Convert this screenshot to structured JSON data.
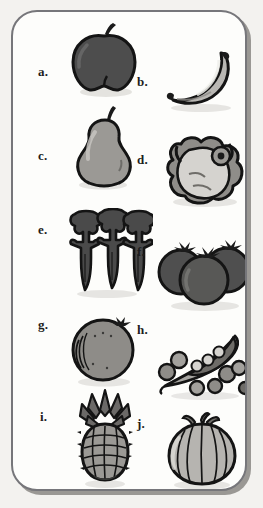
{
  "worksheet": {
    "title": "Fruits and vegetables picture panel",
    "panel": {
      "background_color": "#fdfdfb",
      "border_color": "#76767a",
      "shadow_color": "#9a9894",
      "page_background": "#f3f2ef"
    },
    "layout": {
      "columns": 2,
      "arrangement": "zigzag",
      "item_count": 10
    },
    "items": [
      {
        "label": "a.",
        "name": "apple",
        "column": "left",
        "tone": "dark-gray"
      },
      {
        "label": "b.",
        "name": "banana",
        "column": "right",
        "tone": "light-gray"
      },
      {
        "label": "c.",
        "name": "pear",
        "column": "left",
        "tone": "mid-gray"
      },
      {
        "label": "d.",
        "name": "lettuce",
        "column": "right",
        "tone": "light-gray"
      },
      {
        "label": "e.",
        "name": "carrots",
        "column": "left",
        "tone": "dark-gray"
      },
      {
        "label": "f.",
        "name": "tomatoes",
        "column": "right",
        "tone": "dark-gray"
      },
      {
        "label": "g.",
        "name": "orange",
        "column": "left",
        "tone": "mid-gray"
      },
      {
        "label": "h.",
        "name": "peas",
        "column": "right",
        "tone": "mid-gray"
      },
      {
        "label": "i.",
        "name": "pineapple",
        "column": "left",
        "tone": "mid-gray"
      },
      {
        "label": "j.",
        "name": "onion",
        "column": "right",
        "tone": "light-gray"
      }
    ]
  }
}
